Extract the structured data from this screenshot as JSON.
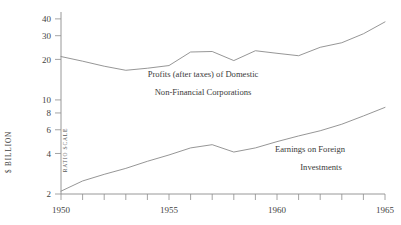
{
  "chart_data": {
    "type": "line",
    "title": "",
    "xlabel": "",
    "ylabel": "$ BILLION",
    "scale_note": "RATIO SCALE",
    "yscale": "log",
    "ylim": [
      2,
      45
    ],
    "xlim": [
      1950,
      1965
    ],
    "grid": false,
    "legend_position": "inline-annotation",
    "y_ticks": [
      2,
      4,
      6,
      8,
      10,
      20,
      30,
      40
    ],
    "y_tick_labels": [
      "2",
      "4",
      "6",
      "8",
      "10",
      "20",
      "30",
      "40"
    ],
    "x_ticks": [
      1950,
      1951,
      1952,
      1953,
      1954,
      1955,
      1956,
      1957,
      1958,
      1959,
      1960,
      1961,
      1962,
      1963,
      1964,
      1965
    ],
    "x_tick_labels": [
      "1950",
      "",
      "",
      "",
      "",
      "1955",
      "",
      "",
      "",
      "",
      "1960",
      "",
      "",
      "",
      "",
      "1965"
    ],
    "x": [
      1950,
      1951,
      1952,
      1953,
      1954,
      1955,
      1956,
      1957,
      1958,
      1959,
      1960,
      1961,
      1962,
      1963,
      1964,
      1965
    ],
    "series": [
      {
        "name": "Profits (after taxes) of Domestic Non-Financial Corporations",
        "label_line_1": "Profits (after taxes) of Domestic",
        "label_line_2": "Non-Financial Corporations",
        "values": [
          21.0,
          19.4,
          17.8,
          16.6,
          17.2,
          18.0,
          22.7,
          22.9,
          19.6,
          23.2,
          22.2,
          21.3,
          24.6,
          26.6,
          31.0,
          38.0
        ]
      },
      {
        "name": "Earnings on Foreign Investments",
        "label_line_1": "Earnings on Foreign",
        "label_line_2": "Investments",
        "values": [
          2.1,
          2.5,
          2.8,
          3.1,
          3.5,
          3.9,
          4.4,
          4.65,
          4.1,
          4.4,
          4.9,
          5.4,
          5.9,
          6.6,
          7.6,
          8.8
        ]
      }
    ]
  },
  "axis": {
    "y_title": "$ BILLION",
    "scale_note": "RATIO SCALE"
  }
}
